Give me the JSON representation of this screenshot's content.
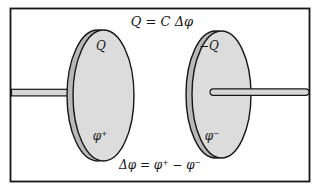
{
  "figure": {
    "top_formula": "Q = C Δφ",
    "bottom_formula": "Δφ = φ⁺ − φ⁻",
    "left_plate": {
      "charge_label": "Q",
      "potential_label": "φ⁺"
    },
    "right_plate": {
      "charge_label": "−Q",
      "potential_label": "φ⁻"
    },
    "colors": {
      "background": "#ffffff",
      "outline": "#161616",
      "plate_face": "#dcdcdc",
      "plate_rim": "#b8b8b8",
      "wire_fill": "#d6d6d6"
    }
  }
}
